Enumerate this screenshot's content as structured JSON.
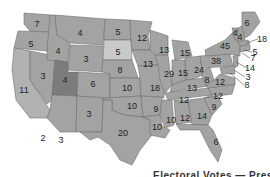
{
  "map": {
    "title": "U.S. Electoral Votes by State",
    "caption_visible": "Electoral Votes — Presidential",
    "colors": {
      "default": "#a3a3a3",
      "highlight_utah": "#7c7c7c",
      "light": "#c9c9c9",
      "border": "#6f6f6f",
      "background": "#ffffff"
    },
    "states": [
      {
        "abbr": "WA",
        "value": "7",
        "x": 37,
        "y": 24
      },
      {
        "abbr": "OR",
        "value": "5",
        "x": 31,
        "y": 44
      },
      {
        "abbr": "CA",
        "value": "11",
        "x": 24,
        "y": 90
      },
      {
        "abbr": "NV",
        "value": "3",
        "x": 43,
        "y": 76
      },
      {
        "abbr": "ID",
        "value": "4",
        "x": 58,
        "y": 51
      },
      {
        "abbr": "MT",
        "value": "4",
        "x": 80,
        "y": 33
      },
      {
        "abbr": "WY",
        "value": "3",
        "x": 86,
        "y": 59
      },
      {
        "abbr": "UT",
        "value": "4",
        "x": 65,
        "y": 80
      },
      {
        "abbr": "AZ",
        "value": "3",
        "x": 61,
        "y": 140
      },
      {
        "abbr": "CA-south",
        "value": "2",
        "x": 43,
        "y": 138
      },
      {
        "abbr": "CO",
        "value": "6",
        "x": 93,
        "y": 84
      },
      {
        "abbr": "NM",
        "value": "3",
        "x": 89,
        "y": 114
      },
      {
        "abbr": "ND",
        "value": "5",
        "x": 118,
        "y": 32
      },
      {
        "abbr": "SD",
        "value": "5",
        "x": 118,
        "y": 52
      },
      {
        "abbr": "NE",
        "value": "8",
        "x": 120,
        "y": 70
      },
      {
        "abbr": "KS",
        "value": "10",
        "x": 127,
        "y": 88
      },
      {
        "abbr": "OK",
        "value": "10",
        "x": 132,
        "y": 106
      },
      {
        "abbr": "TX",
        "value": "20",
        "x": 123,
        "y": 133
      },
      {
        "abbr": "MN",
        "value": "12",
        "x": 142,
        "y": 38
      },
      {
        "abbr": "IA",
        "value": "13",
        "x": 148,
        "y": 64
      },
      {
        "abbr": "MO",
        "value": "18",
        "x": 155,
        "y": 88
      },
      {
        "abbr": "AR",
        "value": "9",
        "x": 156,
        "y": 109
      },
      {
        "abbr": "LA",
        "value": "10",
        "x": 157,
        "y": 127
      },
      {
        "abbr": "WI",
        "value": "13",
        "x": 164,
        "y": 50
      },
      {
        "abbr": "IL",
        "value": "29",
        "x": 169,
        "y": 74
      },
      {
        "abbr": "MI",
        "value": "15",
        "x": 185,
        "y": 53
      },
      {
        "abbr": "IN",
        "value": "15",
        "x": 183,
        "y": 73
      },
      {
        "abbr": "OH",
        "value": "24",
        "x": 199,
        "y": 70
      },
      {
        "abbr": "KY",
        "value": "13",
        "x": 192,
        "y": 88
      },
      {
        "abbr": "TN",
        "value": "12",
        "x": 184,
        "y": 100
      },
      {
        "abbr": "MS",
        "value": "10",
        "x": 171,
        "y": 120
      },
      {
        "abbr": "AL",
        "value": "12",
        "x": 185,
        "y": 118
      },
      {
        "abbr": "GA",
        "value": "14",
        "x": 202,
        "y": 116
      },
      {
        "abbr": "SC",
        "value": "9",
        "x": 214,
        "y": 107
      },
      {
        "abbr": "NC",
        "value": "12",
        "x": 218,
        "y": 96
      },
      {
        "abbr": "FL",
        "value": "6",
        "x": 216,
        "y": 142
      },
      {
        "abbr": "WV",
        "value": "8",
        "x": 207,
        "y": 80
      },
      {
        "abbr": "VA",
        "value": "12",
        "x": 220,
        "y": 82
      },
      {
        "abbr": "PA",
        "value": "38",
        "x": 216,
        "y": 61
      },
      {
        "abbr": "NY",
        "value": "45",
        "x": 225,
        "y": 46
      },
      {
        "abbr": "VT",
        "value": "4",
        "x": 235,
        "y": 33
      },
      {
        "abbr": "NH",
        "value": "4",
        "x": 240,
        "y": 37
      },
      {
        "abbr": "ME",
        "value": "6",
        "x": 247,
        "y": 23
      },
      {
        "abbr": "MA",
        "value": "18",
        "x": 262,
        "y": 39
      },
      {
        "abbr": "RI",
        "value": "5",
        "x": 255,
        "y": 52
      },
      {
        "abbr": "CT",
        "value": "7",
        "x": 253,
        "y": 58
      },
      {
        "abbr": "NJ",
        "value": "14",
        "x": 250,
        "y": 68
      },
      {
        "abbr": "DE",
        "value": "3",
        "x": 248,
        "y": 77
      },
      {
        "abbr": "MD",
        "value": "8",
        "x": 247,
        "y": 85
      }
    ]
  }
}
